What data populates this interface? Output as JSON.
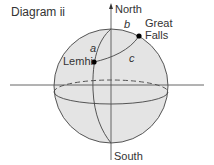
{
  "title": "Diagram ii",
  "labels": {
    "north": "North",
    "south": "South",
    "great_falls_line1": "Great",
    "great_falls_line2": "Falls",
    "lemhi": "Lemhi",
    "arc_a": "a",
    "arc_b": "b",
    "arc_c": "c"
  },
  "colors": {
    "sphere_fill": "#e4e4e4",
    "line": "#444444"
  }
}
